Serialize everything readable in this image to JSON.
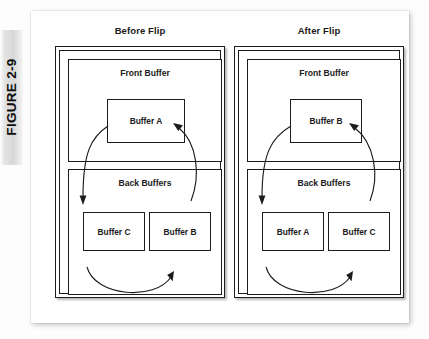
{
  "figure": {
    "label": "FIGURE 2-9"
  },
  "panels": [
    {
      "id": "before",
      "title": "Before Flip",
      "front_section": {
        "title": "Front Buffer",
        "buffer": "Buffer A"
      },
      "back_section": {
        "title": "Back Buffers",
        "left_buffer": "Buffer C",
        "right_buffer": "Buffer B"
      }
    },
    {
      "id": "after",
      "title": "After Flip",
      "front_section": {
        "title": "Front Buffer",
        "buffer": "Buffer B"
      },
      "back_section": {
        "title": "Back Buffers",
        "left_buffer": "Buffer A",
        "right_buffer": "Buffer C"
      }
    }
  ],
  "colors": {
    "ink": "#1c1c1c",
    "page": "#ffffff",
    "tab": "#d6d6d6"
  }
}
